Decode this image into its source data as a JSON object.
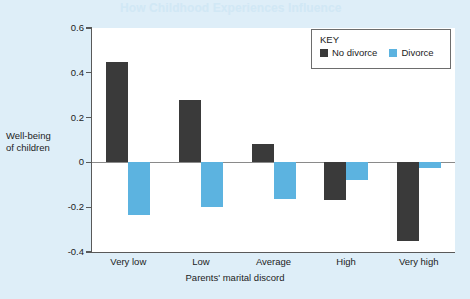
{
  "page": {
    "faded_header_text": "How Childhood Experiences Influence"
  },
  "colors": {
    "background": "#deeef8",
    "plot_background": "#ffffff",
    "series_no_divorce": "#3a3a3a",
    "series_divorce": "#5cb3e0",
    "axis": "#595959",
    "zero_line": "#8a8a8a",
    "text": "#1c1c1c"
  },
  "legend": {
    "title": "KEY",
    "items": [
      {
        "label": "No divorce",
        "color": "#3a3a3a"
      },
      {
        "label": "Divorce",
        "color": "#5cb3e0"
      }
    ]
  },
  "axes": {
    "ylabel_line1": "Well-being",
    "ylabel_line2": "of children",
    "xlabel": "Parents' marital discord",
    "yticks": [
      "0.6",
      "0.4",
      "0.2",
      "0",
      "-0.2",
      "-0.4"
    ],
    "ytick_values": [
      0.6,
      0.4,
      0.2,
      0,
      -0.2,
      -0.4
    ]
  },
  "chart_data": {
    "type": "bar",
    "title": "",
    "subtitle": "",
    "categories": [
      "Very low",
      "Low",
      "Average",
      "High",
      "Very high"
    ],
    "series": [
      {
        "name": "No divorce",
        "color": "#3a3a3a",
        "values": [
          0.45,
          0.28,
          0.08,
          -0.17,
          -0.35
        ]
      },
      {
        "name": "Divorce",
        "color": "#5cb3e0",
        "values": [
          -0.235,
          -0.2,
          -0.165,
          -0.08,
          -0.025
        ]
      }
    ],
    "xlabel": "Parents' marital discord",
    "ylabel": "Well-being of children",
    "ylim": [
      -0.4,
      0.6
    ],
    "yticks": [
      -0.4,
      -0.2,
      0,
      0.2,
      0.4,
      0.6
    ],
    "grid": false,
    "legend_position": "top-right",
    "legend_title": "KEY",
    "zero_reference_line": true
  }
}
